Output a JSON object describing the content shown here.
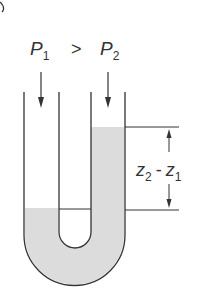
{
  "diagram": {
    "corner_label": "b",
    "labels": {
      "p1": "P",
      "p1_sub": "1",
      "relation": ">",
      "p2": "P",
      "p2_sub": "2",
      "height_z2": "z",
      "height_z2_sub": "2",
      "height_minus": "-",
      "height_z1": "z",
      "height_z1_sub": "1"
    },
    "colors": {
      "stroke": "#333333",
      "fluid": "#dcdcdc",
      "background": "#ffffff"
    }
  }
}
